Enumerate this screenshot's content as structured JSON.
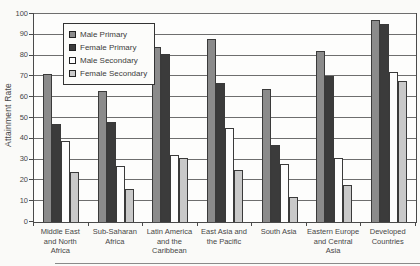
{
  "chart_data": {
    "type": "bar",
    "title": "",
    "xlabel": "",
    "ylabel": "Attainment Rate",
    "ylim": [
      0,
      100
    ],
    "ytick_step": 10,
    "grid": true,
    "legend_position": "upper-left-inside",
    "categories": [
      "Middle East and North Africa",
      "Sub-Saharan Africa",
      "Latin America and the Caribbean",
      "East Asia and the Pacific",
      "South Asia",
      "Eastern Europe and Central Asia",
      "Developed Countries"
    ],
    "category_label_lines": [
      [
        "Middle East",
        "and North",
        "Africa"
      ],
      [
        "Sub-Saharan",
        "Africa"
      ],
      [
        "Latin America",
        "and the",
        "Caribbean"
      ],
      [
        "East Asia and",
        "the Pacific"
      ],
      [
        "South Asia"
      ],
      [
        "Eastern Europe",
        "and Central",
        "Asia"
      ],
      [
        "Developed",
        "Countries"
      ]
    ],
    "series": [
      {
        "name": "Male Primary",
        "color": "#8b8b8b",
        "values": [
          71,
          63,
          84,
          88,
          64,
          82,
          97
        ]
      },
      {
        "name": "Female Primary",
        "color": "#3b3b3b",
        "values": [
          47,
          48,
          81,
          67,
          37,
          70,
          95
        ]
      },
      {
        "name": "Male Secondary",
        "color": "#fdfdfd",
        "values": [
          39,
          27,
          32,
          45,
          28,
          31,
          72
        ]
      },
      {
        "name": "Female Secondary",
        "color": "#c9c9c9",
        "values": [
          24,
          16,
          31,
          25,
          12,
          18,
          68
        ]
      }
    ]
  },
  "style": {
    "plot_border_color": "#4a4a4a",
    "gridline_color": "#6e6e6e",
    "background_color": "#fafaf8",
    "text_color": "#474747"
  }
}
